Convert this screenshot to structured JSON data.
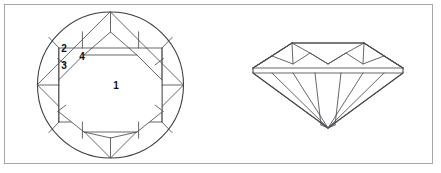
{
  "figure": {
    "background_color": "#ffffff",
    "border_color": "#a8a8ac",
    "line_color": "#4c4c50",
    "outline_color": "#3a3a3e",
    "label_color": "#111114"
  },
  "crown_view": {
    "name": "Round brilliant — crown (top) view",
    "center_x": 110.5,
    "center_y": 85,
    "radius": 73,
    "labels": [
      {
        "id": "label-1",
        "text": "1",
        "facet": "table",
        "x": 116,
        "y": 89
      },
      {
        "id": "label-2",
        "text": "2",
        "facet": "star",
        "x": 64,
        "y": 52
      },
      {
        "id": "label-3",
        "text": "3",
        "facet": "upper-girdle",
        "x": 64,
        "y": 69
      },
      {
        "id": "label-4",
        "text": "4",
        "facet": "bezel",
        "x": 82,
        "y": 60
      }
    ]
  },
  "profile_view": {
    "name": "Round brilliant — profile (side) view",
    "left_x": 253,
    "right_x": 403,
    "table_y": 43,
    "girdle_y": 70,
    "culet_y": 128
  }
}
